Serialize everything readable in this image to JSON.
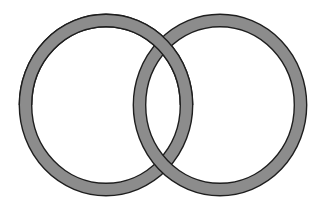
{
  "diagram": {
    "type": "interlocking-rings",
    "background": "#ffffff",
    "ring_fill": "#8c8c8c",
    "ring_outline": "#1e1e1e",
    "ring_thickness": 11,
    "outline_width": 1.4,
    "rings": [
      {
        "name": "left-ring",
        "cx": 106,
        "cy": 105,
        "r": 80.5,
        "ry": 84.5
      },
      {
        "name": "right-ring",
        "cx": 220,
        "cy": 105,
        "r": 80.5,
        "ry": 84.5
      }
    ]
  }
}
